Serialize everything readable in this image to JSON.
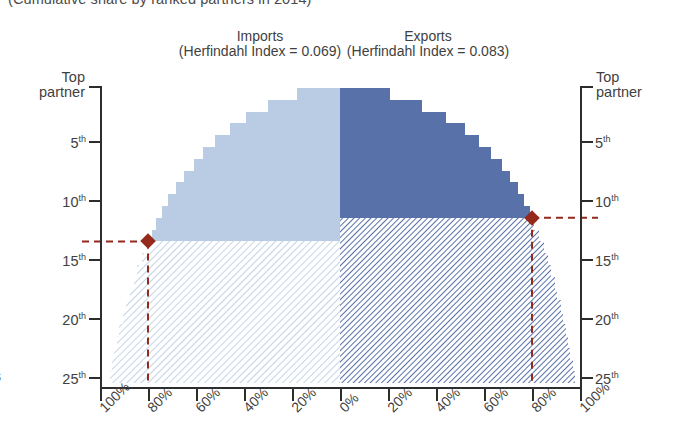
{
  "caption": "(Cumulative share by ranked partners in 2014)",
  "panels": {
    "imports": {
      "title": "Imports",
      "subtitle": "(Herfindahl Index = 0.069)",
      "herfindahl_index": 0.069,
      "color_solid": "#b9cce3",
      "color_hatch": "#dce7f3",
      "marker_rank": 13,
      "marker_share": 80
    },
    "exports": {
      "title": "Exports",
      "subtitle": "(Herfindahl Index = 0.083)",
      "herfindahl_index": 0.083,
      "color_solid": "#5871a8",
      "color_hatch": "#8fa3c8",
      "marker_rank": 11,
      "marker_share": 80
    }
  },
  "axes": {
    "y_left_top_label_line1": "Top",
    "y_left_top_label_line2": "partner",
    "y_right_top_label_line1": "Top",
    "y_right_top_label_line2": "partner",
    "y_ticks": [
      "5",
      "10",
      "15",
      "20",
      "25"
    ],
    "y_tick_suffix": "th",
    "y_ranks": [
      1,
      5,
      10,
      15,
      20,
      25
    ],
    "x_ticks": [
      "100%",
      "80%",
      "60%",
      "40%",
      "20%",
      "0%",
      "20%",
      "40%",
      "60%",
      "80%",
      "100%"
    ],
    "x_tick_values": [
      100,
      80,
      60,
      40,
      20,
      0,
      20,
      40,
      60,
      80,
      100
    ]
  },
  "marker_color": "#94291c",
  "axis_color": "#2d2d2d",
  "chart_data": {
    "type": "area",
    "title": "Cumulative share by ranked partners in 2014",
    "subtitle": "Trade concentration: Imports and Exports cumulative share by ranked partner",
    "xlabel": "",
    "ylabel": "Partner rank",
    "xlim": [
      -100,
      100
    ],
    "ylim": [
      25,
      1
    ],
    "grid": false,
    "legend": "none",
    "orientation": "diverging-horizontal",
    "categories": [
      "Top partner",
      "2nd",
      "3rd",
      "4th",
      "5th",
      "6th",
      "7th",
      "8th",
      "9th",
      "10th",
      "11th",
      "12th",
      "13th",
      "14th",
      "15th",
      "16th",
      "17th",
      "18th",
      "19th",
      "20th",
      "21st",
      "22nd",
      "23rd",
      "24th",
      "25th"
    ],
    "rank_values": [
      1,
      2,
      3,
      4,
      5,
      6,
      7,
      8,
      9,
      10,
      11,
      12,
      13,
      14,
      15,
      16,
      17,
      18,
      19,
      20,
      21,
      22,
      23,
      24,
      25
    ],
    "series": [
      {
        "name": "Imports",
        "direction": "left",
        "color": "#b9cce3",
        "hatch_color": "#dce7f3",
        "cumulative_share_pct": [
          18,
          30,
          39,
          46,
          52,
          57,
          61,
          65,
          68.5,
          71.5,
          74,
          76.5,
          78.5,
          80.5,
          82.5,
          84.5,
          86,
          87.5,
          89,
          90.5,
          92,
          93,
          94,
          95,
          96
        ],
        "marker": {
          "rank": 13,
          "share_pct": 80
        }
      },
      {
        "name": "Exports",
        "direction": "right",
        "color": "#5871a8",
        "hatch_color": "#8fa3c8",
        "cumulative_share_pct": [
          21,
          34,
          44,
          52,
          58,
          63,
          67.5,
          71,
          74,
          76.5,
          79,
          81,
          83,
          85,
          86.5,
          88,
          89.5,
          90.5,
          92,
          93,
          94,
          95,
          96,
          97,
          98
        ],
        "marker": {
          "rank": 11,
          "share_pct": 80
        }
      }
    ],
    "annotations": [
      {
        "text": "Imports (Herfindahl Index = 0.069)",
        "side": "left"
      },
      {
        "text": "Exports (Herfindahl Index = 0.083)",
        "side": "right"
      },
      {
        "text": "80% cumulative share reference line",
        "side": "both"
      }
    ]
  }
}
